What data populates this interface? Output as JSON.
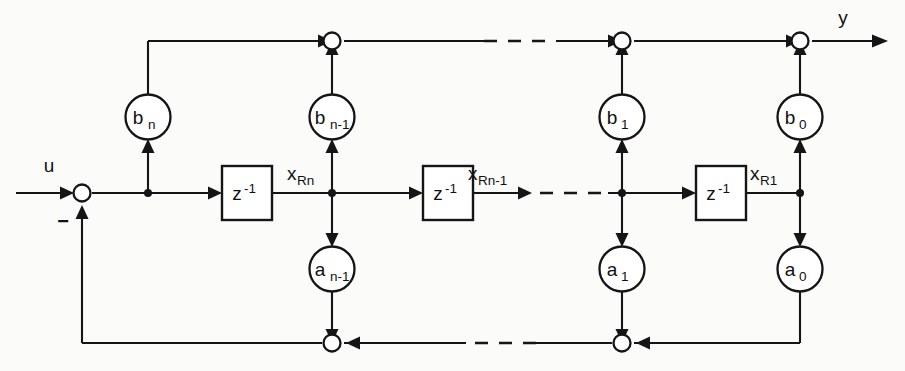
{
  "diagram": {
    "background_color": "#fbfbf9",
    "line_color": "#151515",
    "signals": {
      "input_label": "u",
      "output_label": "y",
      "sum_sign_label": "−"
    },
    "state_labels": [
      {
        "id": "x-rn",
        "base": "x",
        "sub": "Rn"
      },
      {
        "id": "x-rn-1",
        "base": "x",
        "sub": "Rn-1"
      },
      {
        "id": "x-r1",
        "base": "x",
        "sub": "R1"
      }
    ],
    "delay_blocks": [
      {
        "id": "delay-1",
        "base": "z",
        "exp": "-1"
      },
      {
        "id": "delay-2",
        "base": "z",
        "exp": "-1"
      },
      {
        "id": "delay-3",
        "base": "z",
        "exp": "-1"
      }
    ],
    "feedforward_gains": [
      {
        "id": "gain-bn",
        "base": "b",
        "sub": "n"
      },
      {
        "id": "gain-bn-1",
        "base": "b",
        "sub": "n-1"
      },
      {
        "id": "gain-b1",
        "base": "b",
        "sub": "1"
      },
      {
        "id": "gain-b0",
        "base": "b",
        "sub": "0"
      }
    ],
    "feedback_gains": [
      {
        "id": "gain-an-1",
        "base": "a",
        "sub": "n-1"
      },
      {
        "id": "gain-a1",
        "base": "a",
        "sub": "1"
      },
      {
        "id": "gain-a0",
        "base": "a",
        "sub": "0"
      }
    ],
    "summing_nodes": [
      {
        "id": "sum-input"
      },
      {
        "id": "sum-top-1"
      },
      {
        "id": "sum-top-2"
      },
      {
        "id": "sum-top-3"
      },
      {
        "id": "sum-bottom-1"
      },
      {
        "id": "sum-bottom-2"
      }
    ]
  }
}
